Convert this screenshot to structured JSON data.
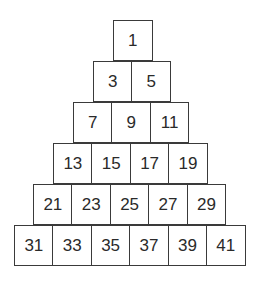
{
  "diagram": {
    "rows": [
      [
        "1"
      ],
      [
        "3",
        "5"
      ],
      [
        "7",
        "9",
        "11"
      ],
      [
        "13",
        "15",
        "17",
        "19"
      ],
      [
        "21",
        "23",
        "25",
        "27",
        "29"
      ],
      [
        "31",
        "33",
        "35",
        "37",
        "39",
        "41"
      ]
    ]
  }
}
